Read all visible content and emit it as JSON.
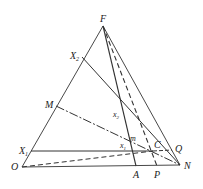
{
  "diagram": {
    "type": "ternary-phase-diagram",
    "colors": {
      "line": "#333333",
      "text": "#222222",
      "background": "#ffffff"
    },
    "points": {
      "F": [
        103,
        26
      ],
      "O": [
        22,
        167
      ],
      "N": [
        180,
        165
      ],
      "X2": [
        82,
        57
      ],
      "M": [
        56,
        106
      ],
      "X1": [
        31,
        151
      ],
      "A": [
        136,
        166
      ],
      "P": [
        157,
        166
      ],
      "C": [
        153,
        151
      ],
      "Q": [
        172,
        150
      ]
    },
    "labels": {
      "F": "F",
      "X2": "X",
      "X2_sub": "2",
      "M": "M",
      "X1": "X",
      "X1_sub": "1",
      "O": "O",
      "A": "A",
      "P": "P",
      "N": "N",
      "C": "C",
      "Q": "Q",
      "x2": "x",
      "x2_sub": "2",
      "m": "m",
      "x1": "x",
      "x1_sub": "1"
    }
  }
}
